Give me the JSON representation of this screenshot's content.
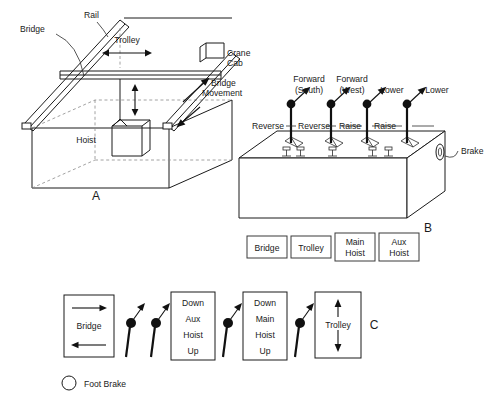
{
  "figure": {
    "panels": [
      {
        "id": "A",
        "name": "overhead-bridge-crane"
      },
      {
        "id": "B",
        "name": "control-console"
      },
      {
        "id": "C",
        "name": "lever-function-legend"
      }
    ]
  },
  "panel_a": {
    "id_label": "A",
    "labels": {
      "rail": "Rail",
      "bridge": "Bridge",
      "trolley": "Trolley",
      "crane_cab_line1": "Crane",
      "crane_cab_line2": "Cab",
      "bridge_movement_line1": "Bridge",
      "bridge_movement_line2": "Movement",
      "hoist": "Hoist"
    }
  },
  "panel_b": {
    "id_label": "B",
    "top_labels": [
      {
        "line1": "Forward",
        "line2": "(South)"
      },
      {
        "line1": "Forward",
        "line2": "(West)"
      },
      {
        "line1": "Lower",
        "line2": ""
      },
      {
        "line1": "Lower",
        "line2": ""
      }
    ],
    "mid_labels": [
      "Reverse",
      "Reverse",
      "Raise",
      "Raise"
    ],
    "brake_label": "Brake",
    "function_boxes": [
      {
        "line1": "Bridge",
        "line2": ""
      },
      {
        "line1": "Trolley",
        "line2": ""
      },
      {
        "line1": "Main",
        "line2": "Hoist"
      },
      {
        "line1": "Aux",
        "line2": "Hoist"
      }
    ]
  },
  "panel_c": {
    "id_label": "C",
    "boxes": [
      {
        "name": "bridge-box",
        "lines": [
          "Bridge"
        ],
        "arrows": "horizontal-both"
      },
      {
        "name": "aux-hoist-box",
        "lines": [
          "Down",
          "Aux",
          "Hoist",
          "Up"
        ],
        "arrows": "none"
      },
      {
        "name": "main-hoist-box",
        "lines": [
          "Down",
          "Main",
          "Hoist",
          "Up"
        ],
        "arrows": "none"
      },
      {
        "name": "trolley-box",
        "lines": [
          "Trolley"
        ],
        "arrows": "vertical-both"
      }
    ],
    "lever_count": 4,
    "legend": {
      "symbol": "circle-outline",
      "text": "Foot Brake"
    }
  },
  "colors": {
    "stroke": "#1a1a1a",
    "dashed": "#8a8a8a",
    "knob": "#111111",
    "background": "#ffffff"
  }
}
